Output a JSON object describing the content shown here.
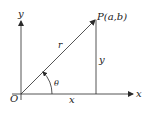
{
  "diagram": {
    "title": "",
    "labels": {
      "y_axis": "y",
      "x_axis": "x",
      "origin": "O",
      "point": "P(a,b)",
      "radius": "r",
      "angle": "θ",
      "vertical_leg": "y",
      "horizontal_leg": "x"
    },
    "colors": {
      "stroke": "#2a2a2a",
      "text": "#1a1a1a",
      "background": "#ffffff"
    }
  }
}
